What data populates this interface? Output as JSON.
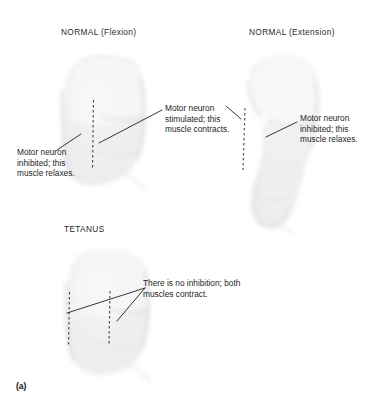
{
  "figure": {
    "caption_label": "(a)",
    "panels": [
      {
        "id": "normal-flexion",
        "title": "NORMAL (Flexion)",
        "callouts": [
          {
            "id": "flexion-inhibited",
            "text": "Motor neuron inhibited; this muscle relaxes."
          },
          {
            "id": "flexion-stimulated",
            "text": "Motor neuron stimulated; this muscle contracts."
          }
        ]
      },
      {
        "id": "normal-extension",
        "title": "NORMAL (Extension)",
        "callouts": [
          {
            "id": "extension-inhibited",
            "text": "Motor neuron inhibited; this muscle relaxes."
          }
        ]
      },
      {
        "id": "tetanus",
        "title": "TETANUS",
        "callouts": [
          {
            "id": "tetanus-no-inhibition",
            "text": "There is no inhibition; both muscles contract."
          }
        ]
      }
    ]
  },
  "colors": {
    "leader_line": "#2b2b2b",
    "dashed_muscle_line": "#4a4a56",
    "arm_fill": "#f2f2f3",
    "arm_shade": "#e4e4e6",
    "text": "#1e1e1e",
    "background": "#ffffff"
  }
}
